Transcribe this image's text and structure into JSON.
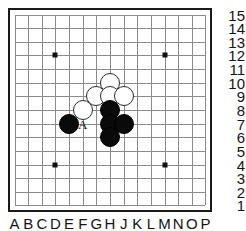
{
  "board": {
    "game": "go",
    "size": 15,
    "columns": [
      "A",
      "B",
      "C",
      "D",
      "E",
      "F",
      "G",
      "H",
      "J",
      "K",
      "L",
      "M",
      "N",
      "O",
      "P"
    ],
    "rows": [
      "15",
      "14",
      "13",
      "12",
      "11",
      "10",
      "9",
      "8",
      "7",
      "6",
      "5",
      "4",
      "3",
      "2",
      "1"
    ],
    "row_labels_side": "right",
    "column_labels_side": "bottom",
    "colors": {
      "border": "#1a1a1a",
      "gridline": "#8a8a8a",
      "background": "#ffffff",
      "black_stone": "#0a0a0a",
      "white_stone": "#ffffff",
      "white_stone_edge": "#2a2a2a",
      "label_text": "#141414"
    },
    "star_points": [
      {
        "col": "D",
        "row": "12"
      },
      {
        "col": "M",
        "row": "12"
      },
      {
        "col": "D",
        "row": "4"
      },
      {
        "col": "M",
        "row": "4"
      }
    ],
    "stones": [
      {
        "color": "white",
        "col": "H",
        "row": "10"
      },
      {
        "color": "white",
        "col": "G",
        "row": "9"
      },
      {
        "color": "white",
        "col": "H",
        "row": "9"
      },
      {
        "color": "white",
        "col": "J",
        "row": "9"
      },
      {
        "color": "white",
        "col": "F",
        "row": "8"
      },
      {
        "color": "black",
        "col": "H",
        "row": "8"
      },
      {
        "color": "black",
        "col": "E",
        "row": "7"
      },
      {
        "color": "black",
        "col": "H",
        "row": "7"
      },
      {
        "color": "black",
        "col": "J",
        "row": "7"
      },
      {
        "color": "black",
        "col": "H",
        "row": "6"
      }
    ],
    "markers": [
      {
        "label": "A",
        "col": "F",
        "row": "7"
      }
    ]
  }
}
